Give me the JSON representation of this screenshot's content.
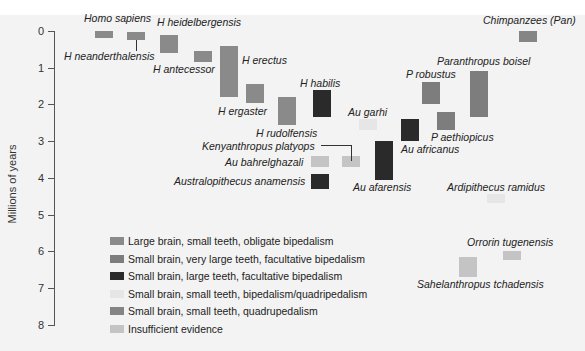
{
  "chart_data": {
    "type": "bar",
    "subtype": "floating-range",
    "title": "",
    "xlabel": "",
    "ylabel": "Millions of years",
    "ylim": [
      0,
      8
    ],
    "y_inverted": true,
    "y_ticks": [
      0,
      1,
      2,
      3,
      4,
      5,
      6,
      7,
      8
    ],
    "grid": false,
    "legend_position": "lower-left",
    "legend": [
      {
        "key": "large_small_obligate",
        "label": "Large brain, small teeth, obligate bipedalism",
        "color": "#8a8a8a"
      },
      {
        "key": "small_verylarge_facultative",
        "label": "Small brain, very large teeth, facultative bipedalism",
        "color": "#7d7d7d"
      },
      {
        "key": "small_large_facultative",
        "label": "Small brain, large teeth, facultative bipedalism",
        "color": "#2a2a2a"
      },
      {
        "key": "small_small_bi_quad",
        "label": "Small brain, small teeth, bipedalism/quadripedalism",
        "color": "#e6e6e6"
      },
      {
        "key": "small_small_quad",
        "label": "Small brain, small teeth, quadrupedalism",
        "color": "#858585"
      },
      {
        "key": "insufficient",
        "label": "Insufficient evidence",
        "color": "#c4c4c4"
      }
    ],
    "series": [
      {
        "name": "Homo sapiens",
        "start": 0.0,
        "end": 0.2,
        "category": "large_small_obligate"
      },
      {
        "name": "H neanderthalensis",
        "start": 0.03,
        "end": 0.25,
        "category": "large_small_obligate"
      },
      {
        "name": "H heidelbergensis",
        "start": 0.1,
        "end": 0.6,
        "category": "large_small_obligate"
      },
      {
        "name": "H antecessor",
        "start": 0.55,
        "end": 0.85,
        "category": "large_small_obligate"
      },
      {
        "name": "H erectus",
        "start": 0.4,
        "end": 1.8,
        "category": "large_small_obligate"
      },
      {
        "name": "H ergaster",
        "start": 1.45,
        "end": 1.95,
        "category": "large_small_obligate"
      },
      {
        "name": "H rudolfensis",
        "start": 1.8,
        "end": 2.55,
        "category": "large_small_obligate"
      },
      {
        "name": "H habilis",
        "start": 1.6,
        "end": 2.35,
        "category": "small_large_facultative"
      },
      {
        "name": "Au garhi",
        "start": 2.4,
        "end": 2.7,
        "category": "small_small_bi_quad"
      },
      {
        "name": "Au africanus",
        "start": 2.4,
        "end": 3.0,
        "category": "small_large_facultative"
      },
      {
        "name": "Kenyanthropus platyops",
        "start": 3.4,
        "end": 3.7,
        "category": "insufficient"
      },
      {
        "name": "Au bahrelghazali",
        "start": 3.4,
        "end": 3.7,
        "category": "insufficient"
      },
      {
        "name": "Australopithecus anamensis",
        "start": 3.9,
        "end": 4.3,
        "category": "small_large_facultative"
      },
      {
        "name": "Au afarensis",
        "start": 3.0,
        "end": 4.05,
        "category": "small_large_facultative"
      },
      {
        "name": "P robustus",
        "start": 1.4,
        "end": 2.0,
        "category": "small_verylarge_facultative"
      },
      {
        "name": "P aethiopicus",
        "start": 2.2,
        "end": 2.7,
        "category": "small_verylarge_facultative"
      },
      {
        "name": "Paranthropus boisei",
        "start": 1.1,
        "end": 2.35,
        "category": "small_verylarge_facultative"
      },
      {
        "name": "Chimpanzees (Pan)",
        "start": 0.0,
        "end": 0.3,
        "category": "small_small_quad"
      },
      {
        "name": "Ardipithecus ramidus",
        "start": 4.45,
        "end": 4.7,
        "category": "small_small_bi_quad"
      },
      {
        "name": "Orrorin tugenensis",
        "start": 6.0,
        "end": 6.25,
        "category": "insufficient"
      },
      {
        "name": "Sahelanthropus tchadensis",
        "start": 6.15,
        "end": 6.7,
        "category": "insufficient"
      }
    ]
  },
  "layout": {
    "y0_px": 31,
    "px_per_unit": 36.7,
    "bar_x": {
      "Homo sapiens": 95,
      "H neanderthalensis": 127,
      "H heidelbergensis": 160,
      "H antecessor": 194,
      "H erectus": 220,
      "H ergaster": 246,
      "H rudolfensis": 278,
      "H habilis": 313,
      "Au garhi": 359,
      "Au africanus": 401,
      "Kenyanthropus platyops": 342,
      "Au bahrelghazali": 311,
      "Australopithecus anamensis": 311,
      "Au afarensis": 375,
      "P robustus": 422,
      "P aethiopicus": 437,
      "Paranthropus boisei": 470,
      "Chimpanzees (Pan)": 519,
      "Ardipithecus ramidus": 487,
      "Orrorin tugenensis": 503,
      "Sahelanthropus tchadensis": 459
    }
  },
  "labels": [
    {
      "text": "Homo sapiens",
      "x": 84,
      "y": 12
    },
    {
      "text": "H neanderthalensis",
      "x": 64,
      "y": 50
    },
    {
      "text": "H heidelbergensis",
      "x": 157,
      "y": 16
    },
    {
      "text": "H antecessor",
      "x": 153,
      "y": 63
    },
    {
      "text": "H erectus",
      "x": 242,
      "y": 54
    },
    {
      "text": "H ergaster",
      "x": 218,
      "y": 105
    },
    {
      "text": "H rudolfensis",
      "x": 256,
      "y": 127
    },
    {
      "text": "H habilis",
      "x": 300,
      "y": 77
    },
    {
      "text": "Au garhi",
      "x": 348,
      "y": 106
    },
    {
      "text": "Kenyanthropus platyops",
      "x": 202,
      "y": 140
    },
    {
      "text": "Au bahrelghazali",
      "x": 225,
      "y": 156
    },
    {
      "text": "Australopithecus anamensis",
      "x": 174,
      "y": 175
    },
    {
      "text": "Au afarensis",
      "x": 353,
      "y": 181
    },
    {
      "text": "Au africanus",
      "x": 401,
      "y": 143
    },
    {
      "text": "P robustus",
      "x": 406,
      "y": 68
    },
    {
      "text": "P aethiopicus",
      "x": 431,
      "y": 131
    },
    {
      "text": "Paranthropus boisel",
      "x": 437,
      "y": 55
    },
    {
      "text": "Chimpanzees (Pan)",
      "x": 483,
      "y": 14
    },
    {
      "text": "Ardipithecus ramidus",
      "x": 447,
      "y": 181
    },
    {
      "text": "Orrorin tugenensis",
      "x": 467,
      "y": 236
    },
    {
      "text": "Sahelanthropus tchadensis",
      "x": 417,
      "y": 278
    }
  ]
}
